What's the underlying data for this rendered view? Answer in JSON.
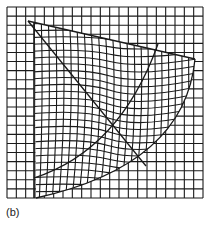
{
  "figure": {
    "label": "(b)",
    "line_color": "#1a1a1a",
    "background": "#ffffff",
    "grid": {
      "x0": 7,
      "y0": 7,
      "x1": 203,
      "y1": 198,
      "cols": 21,
      "rows": 21
    },
    "sector": {
      "apex": [
        28,
        21
      ],
      "top_edge_end": [
        195,
        59
      ],
      "bottom_end": [
        36,
        198
      ],
      "outer_arc_ctrl": [
        185,
        165
      ],
      "diagonal_end": [
        146,
        166
      ],
      "inner_arc_start": [
        34,
        178
      ],
      "inner_arc_end": [
        158,
        44
      ],
      "inner_arc_ctrl": [
        120,
        150
      ]
    }
  }
}
